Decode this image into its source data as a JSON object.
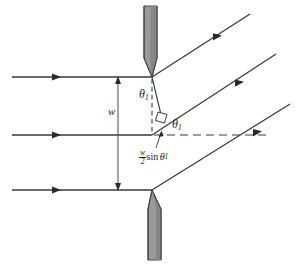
{
  "figure": {
    "type": "optics-ray-diagram",
    "labels": {
      "slit_width": "w",
      "theta_vertical": "θ",
      "theta_vertical_sub": "1",
      "theta_horizontal": "θ",
      "theta_horizontal_sub": "1",
      "path_difference_numerator": "w",
      "path_difference_denominator": "2",
      "path_difference_sin": "sin",
      "path_difference_theta": "θ",
      "path_difference_theta_sub": "1"
    },
    "colors": {
      "ink": "#1a1a1a",
      "line": "#3a3a3a",
      "barrier_fill": "#9a9a9a",
      "barrier_fill_dark": "#7d7d7d",
      "barrier_edge": "#4a4a4a",
      "background": "#ffffff"
    },
    "geometry": {
      "slit_top_edge": {
        "x": 152,
        "y": 77
      },
      "slit_bottom_edge": {
        "x": 152,
        "y": 190
      },
      "midline_point": {
        "x": 152,
        "y": 135
      },
      "slit_width_px": 113,
      "diffraction_angle_deg": 33,
      "incoming_ray_y": [
        77,
        135,
        190
      ],
      "incoming_ray_x_start": 12,
      "incoming_arrow_x": 55,
      "outgoing_rays": 3,
      "perpendicular_foot": {
        "x": 160,
        "y": 121
      }
    },
    "elements": {
      "upper_barrier": "upper-barrier-plate",
      "lower_barrier": "lower-barrier-plate",
      "incoming_rays": "incident-wavefront-rays",
      "outgoing_rays": "diffracted-rays",
      "width_arrow": "slit-width-dimension-arrow",
      "vertical_dashed": "vertical-reference-dashed-line",
      "horizontal_dashed": "horizontal-reference-dashed-line",
      "right_angle_marker": "right-angle-square-marker",
      "path_difference_segment": "path-difference-segment",
      "leader_line": "path-difference-leader-line"
    }
  }
}
